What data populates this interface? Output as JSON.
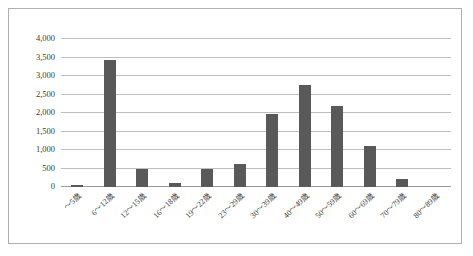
{
  "chart_data": {
    "type": "bar",
    "title": "",
    "subtitle": "",
    "xlabel": "",
    "ylabel": "",
    "categories": [
      "～5歳",
      "6～12歳",
      "12～15歳",
      "16～18歳",
      "19～22歳",
      "23～29歳",
      "30～39歳",
      "40～49歳",
      "50～59歳",
      "60～69歳",
      "70～79歳",
      "80～89歳"
    ],
    "values": [
      50,
      3430,
      490,
      120,
      480,
      620,
      1980,
      2760,
      2200,
      1100,
      230,
      0
    ],
    "ylim": [
      0,
      4000
    ],
    "ytick_values": [
      0,
      500,
      1000,
      1500,
      2000,
      2500,
      3000,
      3500,
      4000
    ],
    "ytick_labels": [
      "0",
      "500",
      "1,000",
      "1,500",
      "2,000",
      "2,500",
      "3,000",
      "3,500",
      "4,000"
    ],
    "grid": true,
    "legend": false,
    "legend_position": "none",
    "series": [
      {
        "name": "",
        "values": [
          50,
          3430,
          490,
          120,
          480,
          620,
          1980,
          2760,
          2200,
          1100,
          230,
          0
        ]
      }
    ],
    "colors": {
      "bar": "#595959",
      "gridline": "#bfbfbf",
      "axis": "#9a9a9a",
      "border": "#b0b0b0",
      "background": "#ffffff",
      "text": "#3a3a3a"
    }
  }
}
